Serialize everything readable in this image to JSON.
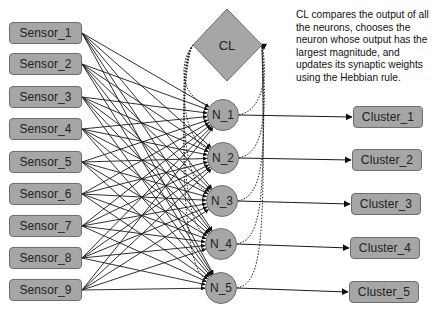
{
  "diagram": {
    "type": "competitive-learning-network",
    "sensors": [
      {
        "label": "Sensor_1",
        "cy": 33
      },
      {
        "label": "Sensor_2",
        "cy": 64
      },
      {
        "label": "Sensor_3",
        "cy": 97
      },
      {
        "label": "Sensor_4",
        "cy": 129
      },
      {
        "label": "Sensor_5",
        "cy": 162
      },
      {
        "label": "Sensor_6",
        "cy": 194
      },
      {
        "label": "Sensor_7",
        "cy": 226
      },
      {
        "label": "Sensor_8",
        "cy": 258
      },
      {
        "label": "Sensor_9",
        "cy": 290
      }
    ],
    "neurons": [
      {
        "label": "N_1",
        "cx": 223,
        "cy": 115
      },
      {
        "label": "N_2",
        "cx": 223,
        "cy": 158
      },
      {
        "label": "N_3",
        "cx": 222,
        "cy": 201
      },
      {
        "label": "N_4",
        "cx": 221,
        "cy": 244
      },
      {
        "label": "N_5",
        "cx": 221,
        "cy": 288
      }
    ],
    "clusters": [
      {
        "label": "Cluster_1",
        "cx": 388,
        "cy": 117
      },
      {
        "label": "Cluster_2",
        "cx": 387,
        "cy": 160
      },
      {
        "label": "Cluster_3",
        "cx": 386,
        "cy": 204
      },
      {
        "label": "Cluster_4",
        "cx": 385,
        "cy": 248
      },
      {
        "label": "Cluster_5",
        "cx": 384,
        "cy": 292
      }
    ],
    "comparator": {
      "label": "CL"
    },
    "note": "CL compares the output of all the neurons, chooses the neuron whose output has the largest magnitude, and updates its synaptic weights using the Hebbian rule.",
    "colors": {
      "node_fill": "#a6a6a6",
      "node_border": "#6e6e6e",
      "edge": "#1a1a1a",
      "background": "#ffffff"
    }
  }
}
